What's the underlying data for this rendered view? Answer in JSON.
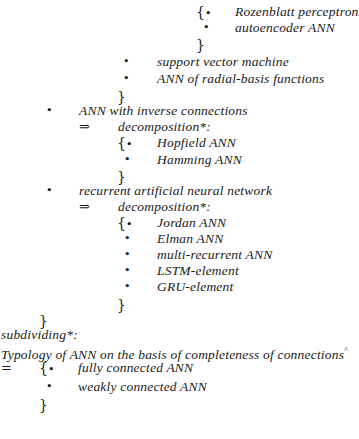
{
  "symbols": {
    "bullet": "•",
    "open_brace": "{",
    "close_brace": "}",
    "implies": "⇒",
    "equals": "="
  },
  "tree": {
    "top_group": {
      "items": [
        "Rozenblatt perceptron",
        "autoencoder ANN"
      ]
    },
    "mid_group": {
      "items": [
        "support vector machine",
        "ANN of radial-basis functions"
      ]
    },
    "inverse": {
      "label": "ANN with inverse connections",
      "relation": "decomposition*:",
      "items": [
        "Hopfield ANN",
        "Hamming ANN"
      ]
    },
    "recurrent": {
      "label": "recurrent artificial neural network",
      "relation": "decomposition*:",
      "items": [
        "Jordan ANN",
        "Elman ANN",
        "multi-recurrent ANN",
        "LSTM-element",
        "GRU-element"
      ]
    },
    "subdividing": {
      "relation": "subdividing*:",
      "title": "Typology of ANN on the basis of completeness of connections",
      "title_mark": "^",
      "items": [
        "fully connected ANN",
        "weakly connected ANN"
      ]
    }
  }
}
